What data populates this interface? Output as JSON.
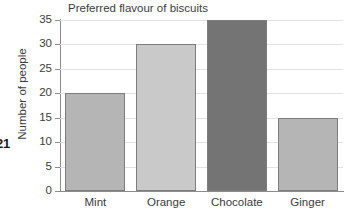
{
  "page_number": "21",
  "chart_data": {
    "type": "bar",
    "title": "Preferred flavour of biscuits",
    "xlabel": "",
    "ylabel": "Number of people",
    "categories": [
      "Mint",
      "Orange",
      "Chocolate",
      "Ginger"
    ],
    "values": [
      20,
      30,
      35,
      15
    ],
    "bar_colors": [
      "#b5b5b5",
      "#c9c9c9",
      "#747474",
      "#b5b5b5"
    ],
    "bar_edge_color": "#7d7d7d",
    "ylim": [
      0,
      35
    ],
    "ytick_labels": [
      "0",
      "5",
      "10",
      "15",
      "20",
      "25",
      "30",
      "35"
    ],
    "ytick_values": [
      0,
      5,
      10,
      15,
      20,
      25,
      30,
      35
    ],
    "grid": "horizontal",
    "gridline_color": "#e2e2e2",
    "axis_color": "#8c8c8c",
    "legend": "none",
    "background": "#ffffff"
  }
}
